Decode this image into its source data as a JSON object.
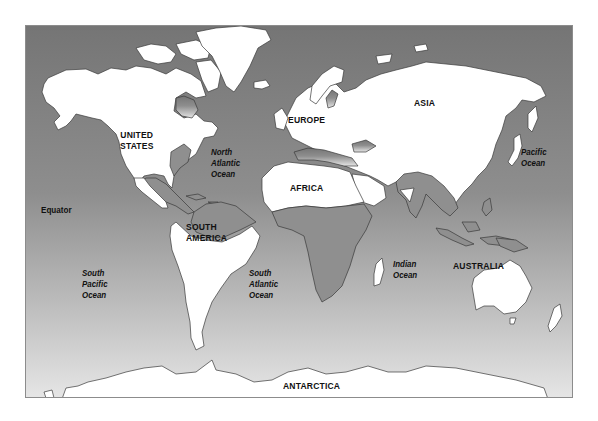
{
  "map": {
    "title": "World Map",
    "colors": {
      "ocean_top": "#777777",
      "ocean_bottom": "#e2e2e2",
      "land": "#ffffff",
      "shaded_land": "#8f8f8f",
      "coastline": "#3a3a3a",
      "border": "#8c8c8c",
      "text": "#111111"
    },
    "continent_labels": {
      "united_states": "UNITED\nSTATES",
      "europe": "EUROPE",
      "asia": "ASIA",
      "africa": "AFRICA",
      "south_america": "SOUTH\nAMERICA",
      "australia": "AUSTRALIA",
      "antarctica": "ANTARCTICA"
    },
    "ocean_labels": {
      "north_atlantic": "North\nAtlantic\nOcean",
      "pacific": "Pacific\nOcean",
      "south_pacific": "South\nPacific\nOcean",
      "south_atlantic": "South\nAtlantic\nOcean",
      "indian": "Indian\nOcean"
    },
    "other_labels": {
      "equator": "Equator"
    }
  }
}
